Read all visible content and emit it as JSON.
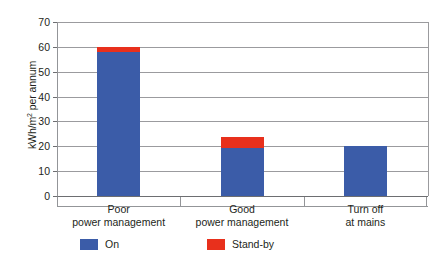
{
  "chart_data": {
    "type": "bar",
    "stacked": true,
    "title": "",
    "xlabel": "",
    "ylabel": "kWh/m² per annum",
    "ylabel_parts": {
      "before": "kWh/m",
      "sup": "2",
      "after": " per annum"
    },
    "ylim": [
      0,
      70
    ],
    "yticks": [
      0,
      10,
      20,
      30,
      40,
      50,
      60,
      70
    ],
    "ytick_labels": [
      "0",
      "10",
      "20",
      "30",
      "40",
      "50",
      "60",
      "70"
    ],
    "grid": "horizontal",
    "legend_position": "bottom",
    "categories": [
      "Poor power management",
      "Good power management",
      "Turn off at mains"
    ],
    "category_lines": [
      [
        "Poor",
        "power management"
      ],
      [
        "Good",
        "power management"
      ],
      [
        "Turn off",
        "at mains"
      ]
    ],
    "series": [
      {
        "name": "On",
        "color": "#3b5ca8",
        "values": [
          58.0,
          19.5,
          20.0
        ]
      },
      {
        "name": "Stand-by",
        "color": "#e8301c",
        "values": [
          1.9,
          4.2,
          0.0
        ]
      }
    ],
    "totals": [
      59.9,
      23.7,
      20.0
    ]
  },
  "legend": {
    "items": [
      {
        "label": "On",
        "color": "#3b5ca8"
      },
      {
        "label": "Stand-by",
        "color": "#e8301c"
      }
    ]
  },
  "colors": {
    "on": "#3b5ca8",
    "standby": "#e8301c",
    "gridline": "#9b9b9e",
    "axis": "#6d6e71",
    "text": "#231f20",
    "background": "#ffffff"
  }
}
